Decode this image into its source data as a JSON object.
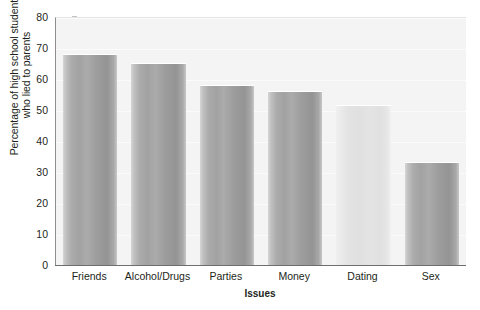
{
  "chart_data": {
    "type": "bar",
    "title": "",
    "subtitle": "",
    "xlabel": "Issues",
    "ylabel": "Percentage of high school students who lied to parents",
    "ylabel_line1": "Percentage of high school students",
    "ylabel_line2": "who lied to parents",
    "categories": [
      "Friends",
      "Alcohol/Drugs",
      "Parties",
      "Money",
      "Dating",
      "Sex"
    ],
    "values": [
      68.5,
      65.5,
      58.5,
      56.5,
      52,
      33.5
    ],
    "ylim": [
      0,
      80
    ],
    "yticks": [
      0,
      10,
      20,
      30,
      40,
      50,
      60,
      70,
      80
    ],
    "ytick_labels": [
      "0",
      "10",
      "20",
      "30",
      "40",
      "50",
      "60",
      "70",
      "80"
    ],
    "grid": true,
    "legend": null,
    "bar_styles": [
      "dark",
      "dark",
      "dark",
      "dark",
      "light",
      "dark"
    ],
    "colors": {
      "bar_dark": "#a2a2a2",
      "bar_light": "#e4e4e4",
      "plot_background": "#f4f4f4",
      "axis_line": "#6e6e6e",
      "gridline": "#fbfbfb",
      "text": "#231f20"
    }
  }
}
